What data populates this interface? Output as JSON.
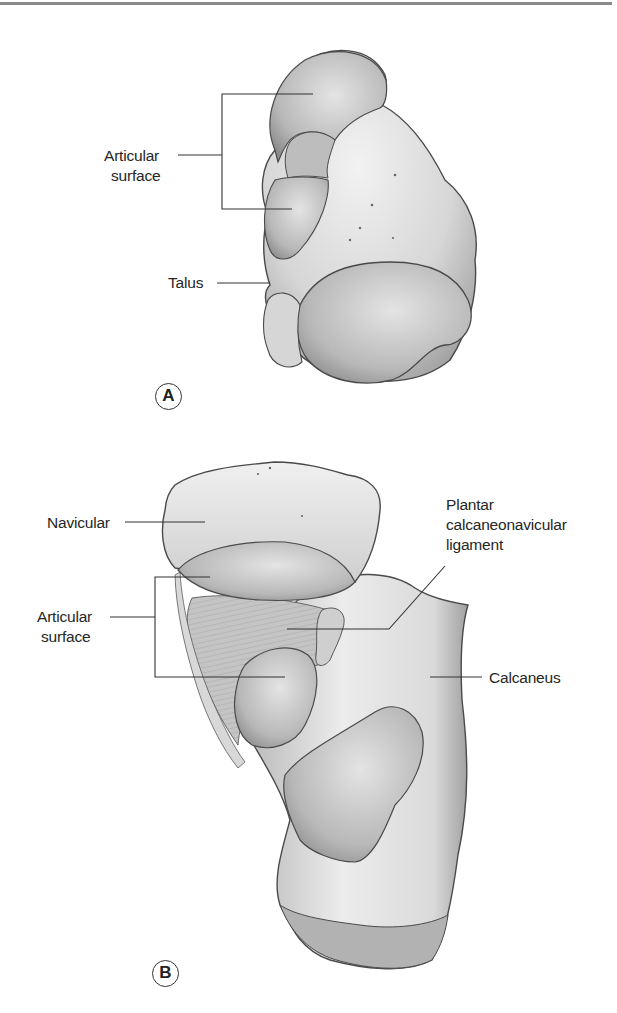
{
  "figure": {
    "panels": [
      {
        "id": "A",
        "tag": "A",
        "structure": "talus",
        "labels": {
          "articular_surface_line1": "Articular",
          "articular_surface_line2": "surface",
          "talus": "Talus"
        }
      },
      {
        "id": "B",
        "tag": "B",
        "structure": "navicular-calcaneus",
        "labels": {
          "navicular": "Navicular",
          "articular_surface_line1": "Articular",
          "articular_surface_line2": "surface",
          "plantar_line1": "Plantar",
          "plantar_line2": "calcaneonavicular",
          "plantar_line3": "ligament",
          "calcaneus": "Calcaneus"
        }
      }
    ],
    "colors": {
      "background": "#ffffff",
      "bone_light": "#ececec",
      "bone_mid": "#c9c9c9",
      "bone_dark": "#9a9a9a",
      "outline": "#4a4a4a",
      "leader_line": "#333333",
      "text": "#262626"
    }
  }
}
